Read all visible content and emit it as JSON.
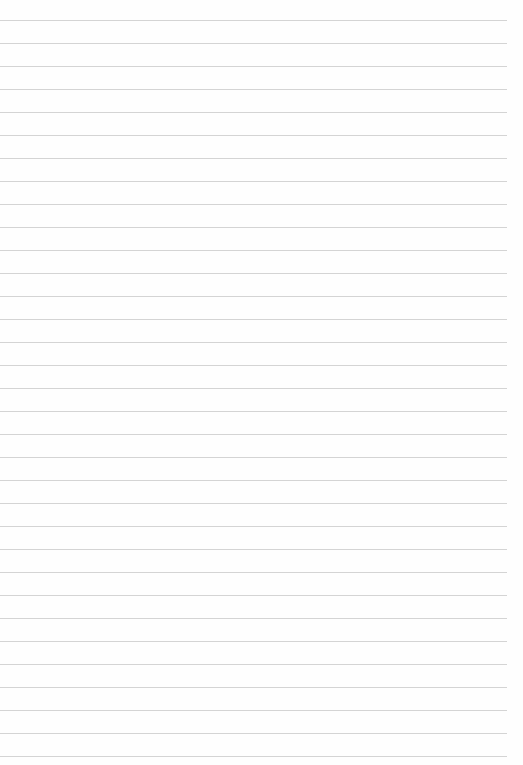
{
  "page": {
    "type": "lined-paper",
    "background": "#fefefe",
    "rule_color": "#d4d4d4",
    "first_rule_y": 20,
    "rule_spacing": 23,
    "rule_count": 33,
    "rule_width": 507
  },
  "faint_marks": [
    {
      "text": "",
      "x": 168,
      "y": 70
    },
    {
      "text": "",
      "x": 345,
      "y": 70
    }
  ]
}
